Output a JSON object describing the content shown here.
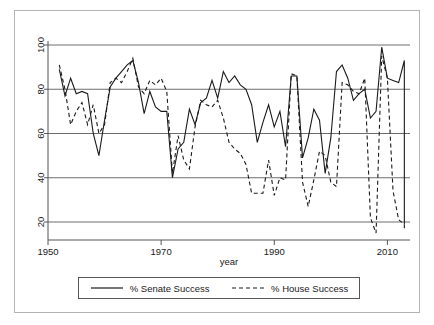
{
  "chart_data": {
    "type": "line",
    "title": "",
    "xlabel": "year",
    "ylabel": "",
    "xlim": [
      1950,
      2014
    ],
    "ylim": [
      14,
      104
    ],
    "grid": true,
    "legend_position": "bottom",
    "xticks": [
      1950,
      1970,
      1990,
      2010
    ],
    "yticks": [
      20,
      40,
      60,
      80,
      100
    ],
    "xtick_labels": [
      "1950",
      "1970",
      "1990",
      "2010"
    ],
    "ytick_labels": [
      "20",
      "40",
      "60",
      "80",
      "100"
    ],
    "series": [
      {
        "name": "% Senate Success",
        "style": "solid",
        "color": "#1a1a1a",
        "x": [
          1952,
          1953,
          1954,
          1955,
          1956,
          1957,
          1958,
          1959,
          1960,
          1961,
          1962,
          1963,
          1964,
          1965,
          1966,
          1967,
          1968,
          1969,
          1970,
          1971,
          1972,
          1973,
          1974,
          1975,
          1976,
          1977,
          1978,
          1979,
          1980,
          1981,
          1982,
          1983,
          1984,
          1985,
          1986,
          1987,
          1988,
          1989,
          1990,
          1991,
          1992,
          1993,
          1994,
          1995,
          1996,
          1997,
          1998,
          1999,
          2000,
          2001,
          2002,
          2003,
          2004,
          2005,
          2006,
          2007,
          2008,
          2009,
          2010,
          2011,
          2012,
          2013
        ],
        "values": [
          89,
          77,
          85,
          78,
          79,
          78,
          60,
          50,
          66,
          81,
          85,
          88,
          91,
          93,
          83,
          69,
          79,
          72,
          70,
          70,
          40,
          53,
          56,
          71,
          64,
          74,
          76,
          84,
          76,
          88,
          83,
          86,
          82,
          80,
          73,
          56,
          65,
          73,
          63,
          70,
          54,
          86,
          86,
          49,
          58,
          71,
          66,
          42,
          58,
          88,
          91,
          85,
          75,
          78,
          80,
          67,
          70,
          99,
          85,
          84,
          83,
          93
        ],
        "series_end_value": 19
      },
      {
        "name": "% House Success",
        "style": "dashed",
        "color": "#1a1a1a",
        "x": [
          1952,
          1953,
          1954,
          1955,
          1956,
          1957,
          1958,
          1959,
          1960,
          1961,
          1962,
          1963,
          1964,
          1965,
          1966,
          1967,
          1968,
          1969,
          1970,
          1971,
          1972,
          1973,
          1974,
          1975,
          1976,
          1977,
          1978,
          1979,
          1980,
          1981,
          1982,
          1983,
          1984,
          1985,
          1986,
          1987,
          1988,
          1989,
          1990,
          1991,
          1992,
          1993,
          1994,
          1995,
          1996,
          1997,
          1998,
          1999,
          2000,
          2001,
          2002,
          2003,
          2004,
          2005,
          2006,
          2007,
          2008,
          2009,
          2010,
          2011,
          2012,
          2013
        ],
        "values": [
          91,
          80,
          64,
          70,
          74,
          64,
          73,
          60,
          64,
          83,
          85,
          83,
          88,
          94,
          81,
          78,
          84,
          82,
          85,
          79,
          42,
          59,
          48,
          44,
          63,
          75,
          73,
          72,
          75,
          67,
          56,
          53,
          51,
          46,
          33,
          33,
          33,
          48,
          32,
          40,
          39,
          87,
          86,
          38,
          27,
          39,
          52,
          50,
          38,
          36,
          83,
          82,
          79,
          78,
          85,
          22,
          15,
          95,
          85,
          34,
          21,
          19
        ],
        "series_end_value": 16
      }
    ]
  },
  "legend": {
    "entries": [
      {
        "label": "% Senate Success",
        "style": "solid"
      },
      {
        "label": "% House Success",
        "style": "dashed"
      }
    ]
  },
  "axis": {
    "x_title": "year"
  }
}
